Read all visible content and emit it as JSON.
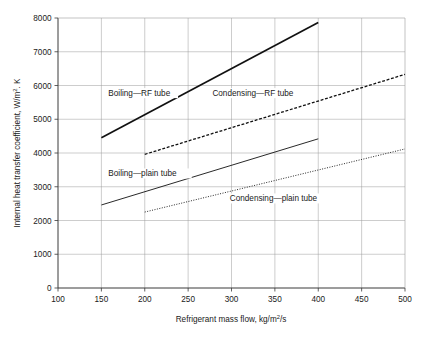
{
  "chart_data": {
    "type": "line",
    "title": "",
    "xlabel": "Refrigerant mass flow, kg/m2/s",
    "xlabel_pre": "Refrigerant mass flow, kg/m",
    "xlabel_sup": "2",
    "xlabel_post": "/s",
    "ylabel": "Internal heat transfer coefficient, W/m2. K",
    "ylabel_pre": "Internal heat transfer coefficient, W/m",
    "ylabel_sup": "2",
    "ylabel_post": ". K",
    "xlim": [
      100,
      500
    ],
    "ylim": [
      0,
      8000
    ],
    "xticks": [
      100,
      150,
      200,
      250,
      300,
      350,
      400,
      450,
      500
    ],
    "xtick_labels": [
      "100",
      "150",
      "200",
      "250",
      "300",
      "350",
      "400",
      "450",
      "500"
    ],
    "yticks": [
      0,
      1000,
      2000,
      3000,
      4000,
      5000,
      6000,
      7000,
      8000
    ],
    "ytick_labels": [
      "0",
      "1000",
      "2000",
      "3000",
      "4000",
      "5000",
      "6000",
      "7000",
      "8000"
    ],
    "grid": true,
    "grid_color": "#9a9a9a",
    "legend_position": "inline-annotations",
    "line_color": "#111111",
    "series": [
      {
        "name": "Boiling—RF tube",
        "style": "solid",
        "width": 1.7,
        "x": [
          150,
          400
        ],
        "y": [
          4450,
          7870
        ]
      },
      {
        "name": "Condensing—RF tube",
        "style": "dashed",
        "width": 1.3,
        "x": [
          200,
          500
        ],
        "y": [
          3960,
          6330
        ]
      },
      {
        "name": "Boiling—plain tube",
        "style": "solid",
        "width": 0.9,
        "x": [
          150,
          400
        ],
        "y": [
          2460,
          4420
        ]
      },
      {
        "name": "Condensing—plain tube",
        "style": "dotted",
        "width": 0.9,
        "x": [
          200,
          500
        ],
        "y": [
          2250,
          4120
        ]
      }
    ],
    "annotations": [
      {
        "text": "Boiling—RF tube",
        "x": 158,
        "y": 5700,
        "anchor": "start"
      },
      {
        "text": "Condensing—RF tube",
        "x": 278,
        "y": 5700,
        "anchor": "start"
      },
      {
        "text": "Boiling—plain tube",
        "x": 158,
        "y": 3320,
        "anchor": "start"
      },
      {
        "text": "Condensing—plain tube",
        "x": 298,
        "y": 2580,
        "anchor": "start"
      }
    ]
  }
}
